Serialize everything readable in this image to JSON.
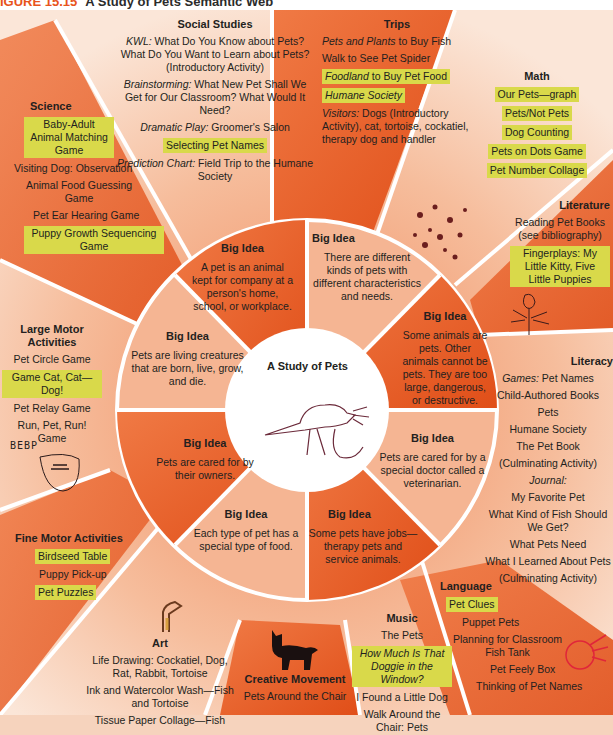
{
  "caption": {
    "figure_label": "IGURE 15.15",
    "title": "A Study of Pets Semantic Web"
  },
  "center": {
    "title": "A Study of Pets",
    "drawing": "child-drawing-rat"
  },
  "colors": {
    "dark_wedge": "#e8591f",
    "light_wedge": "#f4b08c",
    "pale": "#f8d8c4",
    "highlight": "#d9d94a",
    "divider": "#ffffff"
  },
  "big_ideas": [
    {
      "heading": "Big Idea",
      "text": "A pet is an animal kept for company at a person's home, school, or workplace."
    },
    {
      "heading": "Big Idea",
      "text": "There are different kinds of pets with different characteristics and needs."
    },
    {
      "heading": "Big Idea",
      "text": "Some animals are pets. Other animals cannot be pets. They are too large, dangerous, or destructive."
    },
    {
      "heading": "Big Idea",
      "text": "Pets are cared for by a special doctor called a veterinarian."
    },
    {
      "heading": "Big Idea",
      "text": "Some pets have jobs—therapy pets and service animals."
    },
    {
      "heading": "Big Idea",
      "text": "Each type of pet has a special type of food."
    },
    {
      "heading": "Big Idea",
      "text": "Pets are cared for by their owners."
    },
    {
      "heading": "Big Idea",
      "text": "Pets are living creatures that are born, live, grow, and die."
    }
  ],
  "areas": {
    "social_studies": {
      "heading": "Social Studies",
      "items": [
        {
          "label": "KWL:",
          "text": " What Do You Know about Pets? What Do You Want to Learn about Pets? (Introductory Activity)"
        },
        {
          "label": "Brainstorming:",
          "text": " What New Pet Shall We Get for Our Classroom? What Would It Need?"
        },
        {
          "label": "Dramatic Play:",
          "text": " Groomer's Salon"
        },
        {
          "label": "",
          "text": "Selecting Pet Names",
          "highlight": true
        },
        {
          "label": "Prediction Chart:",
          "text": " Field Trip to the Humane Society"
        }
      ]
    },
    "trips": {
      "heading": "Trips",
      "items": [
        {
          "label": "Pets and Plants",
          "text": " to Buy Fish"
        },
        {
          "label": "",
          "text": "Walk to See Pet Spider"
        },
        {
          "label": "Foodland",
          "text": " to Buy Pet Food",
          "highlight": true
        },
        {
          "label": "Humane Society",
          "text": "",
          "highlight": true
        },
        {
          "label": "Visitors:",
          "text": " Dogs (Introductory Activity), cat, tortoise, cockatiel, therapy dog and handler"
        }
      ]
    },
    "math": {
      "heading": "Math",
      "items": [
        "Our Pets—graph",
        "Pets/Not Pets",
        "Dog Counting",
        "Pets on Dots Game",
        "Pet Number Collage"
      ]
    },
    "literature": {
      "heading": "Literature",
      "items": [
        {
          "text": "Reading Pet Books (see bibliography)",
          "highlight": false
        },
        {
          "text": "Fingerplays: My Little Kitty, Five Little Puppies",
          "highlight": true
        }
      ]
    },
    "literacy": {
      "heading": "Literacy",
      "games_label": "Games:",
      "games_text": " Pet Names",
      "items": [
        "Child-Authored Books",
        "Pets",
        "Humane Society",
        "The Pet Book",
        "(Culminating Activity)"
      ],
      "journal_label": "Journal:",
      "journal_items": [
        "My Favorite Pet",
        "What Kind of Fish Should We Get?",
        "What Pets Need",
        "What I Learned About Pets",
        "(Culminating Activity)"
      ]
    },
    "language": {
      "heading": "Language",
      "items": [
        {
          "text": "Pet Clues",
          "highlight": true
        },
        {
          "text": "Puppet Pets",
          "highlight": false
        },
        {
          "text": "Planning for Classroom Fish Tank",
          "highlight": false
        },
        {
          "text": "Pet Feely Box",
          "highlight": false
        },
        {
          "text": "Thinking of Pet Names",
          "highlight": false
        }
      ]
    },
    "music": {
      "heading": "Music",
      "items": [
        {
          "text": "The Pets",
          "italic": false,
          "highlight": false
        },
        {
          "text": "How Much Is That Doggie in the Window?",
          "italic": true,
          "highlight": true
        },
        {
          "text": "I Found a Little Dog",
          "italic": false,
          "highlight": false
        },
        {
          "text": "Walk Around the Chair: Pets",
          "italic": false,
          "highlight": false
        }
      ]
    },
    "creative_movement": {
      "heading": "Creative Movement",
      "items": [
        "Pets Around the Chair",
        "Pet Movin' Back..."
      ]
    },
    "art": {
      "heading": "Art",
      "items": [
        "Life Drawing: Cockatiel, Dog, Rat, Rabbit, Tortoise",
        "Ink and Watercolor Wash—Fish and Tortoise",
        "Tissue Paper Collage—Fish"
      ]
    },
    "fine_motor": {
      "heading": "Fine Motor Activities",
      "items": [
        {
          "text": "Birdseed Table",
          "highlight": true
        },
        {
          "text": "Puppy Pick-up",
          "highlight": false
        },
        {
          "text": "Pet Puzzles",
          "highlight": true
        }
      ]
    },
    "large_motor": {
      "heading": "Large Motor Activities",
      "items": [
        {
          "text": "Pet Circle Game",
          "highlight": false
        },
        {
          "text": "Game Cat, Cat—Dog!",
          "highlight": true
        },
        {
          "text": "Pet Relay Game",
          "highlight": false
        },
        {
          "text": "Run, Pet, Run! Game",
          "highlight": false
        }
      ],
      "doodle_text": "BEBP"
    },
    "science": {
      "heading": "Science",
      "items": [
        {
          "text": "Baby-Adult Animal Matching Game",
          "highlight": true
        },
        {
          "text": "Visiting Dog: Observation",
          "highlight": false
        },
        {
          "text": "Animal Food Guessing Game",
          "highlight": false
        },
        {
          "text": "Pet Ear Hearing Game",
          "highlight": false
        },
        {
          "text": "Puppy Growth Sequencing Game",
          "highlight": true
        }
      ]
    }
  }
}
